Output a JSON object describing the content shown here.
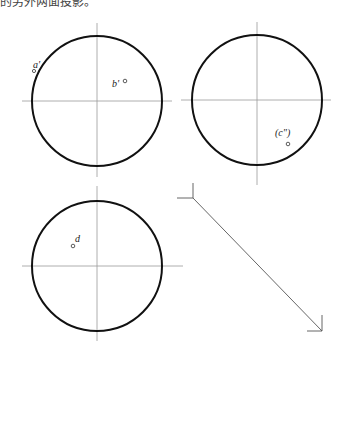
{
  "header": {
    "text": "的另外两面投影。"
  },
  "colors": {
    "outline": "#111111",
    "centerline": "#9a9a9a",
    "projection_line": "#555555",
    "point": "#333333"
  },
  "views": [
    {
      "name": "front-view",
      "cx": 97,
      "cy": 101,
      "r": 65,
      "points": [
        {
          "label": "a'",
          "px": 34,
          "py": 71,
          "lx": 32,
          "ly": 68
        },
        {
          "label": "b'",
          "px": 125,
          "py": 79,
          "lx": 112,
          "ly": 85
        }
      ]
    },
    {
      "name": "side-view",
      "cx": 257,
      "cy": 100,
      "r": 65,
      "points": [
        {
          "label": "(c\")",
          "px": 288,
          "py": 144,
          "lx": 275,
          "ly": 135
        }
      ]
    },
    {
      "name": "top-view",
      "cx": 97,
      "cy": 266,
      "r": 65,
      "points": [
        {
          "label": "d",
          "px": 73,
          "py": 246,
          "lx": 75,
          "ly": 241
        }
      ]
    }
  ],
  "projection_line": {
    "x1": 193,
    "y1": 198,
    "x2": 322,
    "y2": 331
  }
}
